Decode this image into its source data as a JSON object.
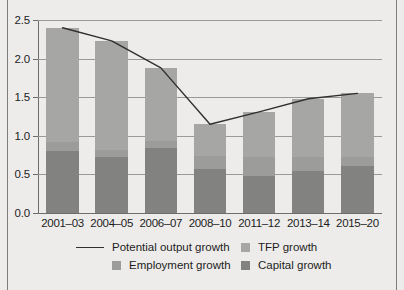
{
  "chart_data": {
    "type": "bar",
    "stacked": true,
    "title": "",
    "subtitle": "",
    "xlabel": "",
    "ylabel": "",
    "categories": [
      "2001–03",
      "2004–05",
      "2006–07",
      "2008–10",
      "2011–12",
      "2013–14",
      "2015–20"
    ],
    "ylim": [
      0.0,
      2.5
    ],
    "ytick_labels": [
      "0.0",
      "0.5",
      "1.0",
      "1.5",
      "2.0",
      "2.5"
    ],
    "ytick_values": [
      0.0,
      0.5,
      1.0,
      1.5,
      2.0,
      2.5
    ],
    "grid": true,
    "legend_position": "bottom",
    "series": [
      {
        "name": "Capital growth",
        "kind": "bar-segment",
        "color": "#828281",
        "values": [
          0.8,
          0.73,
          0.84,
          0.57,
          0.48,
          0.55,
          0.61
        ]
      },
      {
        "name": "Employment growth",
        "kind": "bar-segment",
        "color": "#9c9c9a",
        "values": [
          0.12,
          0.08,
          0.09,
          0.17,
          0.24,
          0.17,
          0.12
        ]
      },
      {
        "name": "TFP growth",
        "kind": "bar-segment",
        "color": "#a6a6a4",
        "values": [
          1.48,
          1.42,
          0.95,
          0.41,
          0.59,
          0.76,
          0.82
        ]
      },
      {
        "name": "Potential output growth",
        "kind": "line",
        "color": "#30302f",
        "values": [
          2.4,
          2.23,
          1.88,
          1.15,
          1.31,
          1.48,
          1.55
        ]
      }
    ],
    "bar_totals": [
      2.4,
      2.23,
      1.88,
      1.15,
      1.31,
      1.48,
      1.55
    ]
  },
  "legend": {
    "items": [
      {
        "label": "Potential output growth",
        "marker": "line",
        "color": "#30302f"
      },
      {
        "label": "TFP growth",
        "marker": "swatch",
        "color": "#a6a6a4"
      },
      {
        "label": "Employment growth",
        "marker": "swatch",
        "color": "#9c9c9a"
      },
      {
        "label": "Capital growth",
        "marker": "swatch",
        "color": "#828281"
      }
    ]
  }
}
